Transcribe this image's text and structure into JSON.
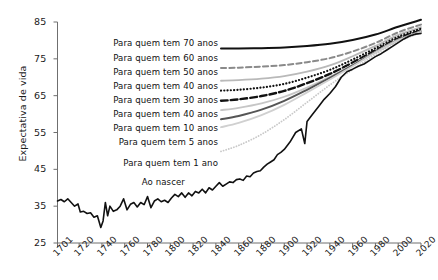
{
  "chart_data": {
    "type": "line",
    "title": "",
    "xlabel": "",
    "ylabel": "Expectativa de vida",
    "xlim": [
      1701,
      2020
    ],
    "ylim": [
      25,
      85
    ],
    "grid": false,
    "legend_position": "inline-left",
    "xticks": [
      "1701",
      "1720",
      "1740",
      "1760",
      "1780",
      "1800",
      "1820",
      "1840",
      "1860",
      "1880",
      "1900",
      "1920",
      "1940",
      "1960",
      "1980",
      "2000",
      "2020"
    ],
    "yticks": [
      "25",
      "35",
      "45",
      "55",
      "65",
      "75",
      "85"
    ],
    "x": [
      1701,
      1720,
      1740,
      1760,
      1780,
      1800,
      1820,
      1840,
      1860,
      1880,
      1900,
      1920,
      1940,
      1960,
      1980,
      2000,
      2020
    ],
    "series": [
      {
        "name": "Para quem tem 70 anos",
        "label": "Para quem tem 70 anos",
        "style": "solid",
        "color": "#111111",
        "width": 2.0,
        "values": [
          78.4,
          78.3,
          78.2,
          78.1,
          78.0,
          78.0,
          77.9,
          77.8,
          77.8,
          77.9,
          78.1,
          78.5,
          79.1,
          80.1,
          81.6,
          83.7,
          85.6
        ]
      },
      {
        "name": "Para quem tem 60 anos",
        "label": "Para quem tem 60 anos",
        "style": "dashed",
        "color": "#8a8a8a",
        "width": 2.0,
        "values": [
          72.9,
          72.8,
          72.7,
          72.6,
          72.5,
          72.5,
          72.5,
          72.5,
          72.6,
          72.9,
          73.3,
          74.1,
          75.2,
          77.0,
          79.3,
          82.2,
          84.3
        ]
      },
      {
        "name": "Para quem tem 50 anos",
        "label": "Para quem tem 50 anos",
        "style": "solid",
        "color": "#b9b9b9",
        "width": 1.8,
        "values": [
          69.3,
          69.2,
          69.1,
          69.0,
          68.9,
          68.9,
          68.9,
          69.0,
          69.2,
          69.6,
          70.3,
          71.5,
          73.2,
          75.7,
          78.5,
          81.5,
          83.6
        ]
      },
      {
        "name": "Para quem tem 40 anos",
        "label": "Para quem tem 40 anos",
        "style": "dotted",
        "color": "#111111",
        "width": 2.2,
        "values": [
          66.4,
          66.3,
          66.2,
          66.1,
          66.0,
          66.0,
          66.1,
          66.3,
          66.6,
          67.2,
          68.2,
          69.9,
          72.0,
          74.8,
          77.9,
          81.0,
          83.2
        ]
      },
      {
        "name": "Para quem tem 30 anos",
        "label": "Para quem tem 30 anos",
        "style": "dashed-thick",
        "color": "#111111",
        "width": 2.4,
        "values": [
          63.6,
          63.4,
          63.2,
          63.1,
          63.0,
          63.0,
          63.2,
          63.5,
          64.0,
          64.9,
          66.3,
          68.4,
          70.9,
          74.0,
          77.3,
          80.5,
          82.8
        ]
      },
      {
        "name": "Para quem tem 40 anos",
        "label": "Para quem tem 40 anos",
        "style": "solid",
        "color": "#c6c6c6",
        "width": 1.8,
        "values": [
          60.8,
          60.5,
          60.3,
          60.1,
          60.0,
          60.1,
          60.4,
          60.9,
          61.7,
          62.9,
          64.7,
          67.2,
          70.1,
          73.4,
          76.9,
          80.2,
          82.5
        ]
      },
      {
        "name": "Para quem tem 10 anos",
        "label": "Para quem tem 10 anos",
        "style": "solid",
        "color": "#555555",
        "width": 2.0,
        "values": [
          57.6,
          57.3,
          57.0,
          56.8,
          56.8,
          57.0,
          57.5,
          58.3,
          59.5,
          61.2,
          63.6,
          66.6,
          69.8,
          73.2,
          76.8,
          80.1,
          82.4
        ]
      },
      {
        "name": "Para quem tem 5 anos",
        "label": "Para quem tem 5 anos",
        "style": "solid",
        "color": "#d0d0d0",
        "width": 1.8,
        "values": [
          55.0,
          54.6,
          54.3,
          54.1,
          54.1,
          54.4,
          55.1,
          56.1,
          57.6,
          59.7,
          62.5,
          65.9,
          69.4,
          73.0,
          76.7,
          80.0,
          82.3
        ]
      },
      {
        "name": "Para quem tem 1 ano",
        "label": "Para quem tem 1 ano",
        "style": "dotted",
        "color": "#c9c9c9",
        "width": 1.8,
        "values": [
          47.0,
          46.5,
          46.2,
          46.1,
          46.3,
          46.9,
          47.9,
          49.4,
          51.5,
          54.5,
          58.5,
          63.2,
          67.9,
          72.1,
          76.2,
          79.7,
          82.1
        ]
      },
      {
        "name": "Ao nascer",
        "label": "Ao nascer",
        "style": "solid",
        "color": "#111111",
        "width": 1.6,
        "values": [
          36.5,
          35.5,
          29.5,
          36.0,
          35.5,
          36.5,
          38.0,
          39.5,
          41.5,
          44.5,
          50.0,
          56.5,
          64.0,
          71.0,
          75.5,
          79.0,
          81.8
        ],
        "noisy_values": [
          [
            1701,
            36.4
          ],
          [
            1704,
            36.8
          ],
          [
            1707,
            36.2
          ],
          [
            1710,
            37.0
          ],
          [
            1713,
            36.0
          ],
          [
            1716,
            35.0
          ],
          [
            1719,
            35.6
          ],
          [
            1721,
            33.4
          ],
          [
            1724,
            33.6
          ],
          [
            1727,
            33.0
          ],
          [
            1730,
            33.2
          ],
          [
            1733,
            32.0
          ],
          [
            1736,
            32.4
          ],
          [
            1739,
            29.2
          ],
          [
            1741,
            31.0
          ],
          [
            1743,
            36.0
          ],
          [
            1745,
            32.4
          ],
          [
            1747,
            35.0
          ],
          [
            1750,
            33.6
          ],
          [
            1753,
            34.0
          ],
          [
            1756,
            35.0
          ],
          [
            1759,
            37.0
          ],
          [
            1762,
            34.0
          ],
          [
            1765,
            35.5
          ],
          [
            1768,
            36.0
          ],
          [
            1771,
            34.8
          ],
          [
            1774,
            36.0
          ],
          [
            1777,
            35.4
          ],
          [
            1780,
            37.6
          ],
          [
            1783,
            34.6
          ],
          [
            1786,
            36.4
          ],
          [
            1789,
            37.0
          ],
          [
            1792,
            36.2
          ],
          [
            1795,
            36.6
          ],
          [
            1798,
            36.0
          ],
          [
            1801,
            37.2
          ],
          [
            1804,
            38.2
          ],
          [
            1807,
            37.6
          ],
          [
            1810,
            38.6
          ],
          [
            1813,
            37.4
          ],
          [
            1816,
            38.6
          ],
          [
            1819,
            37.8
          ],
          [
            1822,
            39.0
          ],
          [
            1825,
            38.6
          ],
          [
            1828,
            39.6
          ],
          [
            1831,
            38.6
          ],
          [
            1834,
            40.0
          ],
          [
            1837,
            39.4
          ],
          [
            1840,
            40.4
          ],
          [
            1843,
            41.4
          ],
          [
            1846,
            40.4
          ],
          [
            1849,
            41.0
          ],
          [
            1852,
            41.6
          ],
          [
            1855,
            41.4
          ],
          [
            1858,
            42.2
          ],
          [
            1861,
            42.4
          ],
          [
            1864,
            42.0
          ],
          [
            1867,
            43.2
          ],
          [
            1870,
            43.0
          ],
          [
            1873,
            44.0
          ],
          [
            1876,
            44.4
          ],
          [
            1879,
            44.6
          ],
          [
            1882,
            45.6
          ],
          [
            1885,
            46.4
          ],
          [
            1888,
            47.0
          ],
          [
            1891,
            47.6
          ],
          [
            1894,
            49.0
          ],
          [
            1897,
            49.6
          ],
          [
            1900,
            50.4
          ],
          [
            1905,
            52.4
          ],
          [
            1910,
            55.0
          ],
          [
            1915,
            56.0
          ],
          [
            1918,
            52.0
          ],
          [
            1920,
            58.0
          ],
          [
            1925,
            60.0
          ],
          [
            1930,
            62.0
          ],
          [
            1935,
            64.0
          ],
          [
            1940,
            65.6
          ],
          [
            1945,
            67.5
          ],
          [
            1950,
            70.0
          ],
          [
            1955,
            71.5
          ],
          [
            1960,
            72.2
          ],
          [
            1965,
            73.0
          ],
          [
            1970,
            73.6
          ],
          [
            1975,
            74.6
          ],
          [
            1980,
            75.6
          ],
          [
            1985,
            76.4
          ],
          [
            1990,
            77.4
          ],
          [
            1995,
            78.4
          ],
          [
            2000,
            79.4
          ],
          [
            2005,
            80.4
          ],
          [
            2010,
            81.2
          ],
          [
            2015,
            81.7
          ],
          [
            2020,
            81.9
          ]
        ]
      }
    ]
  },
  "axis": {
    "y_title": "Expectativa de vida"
  }
}
